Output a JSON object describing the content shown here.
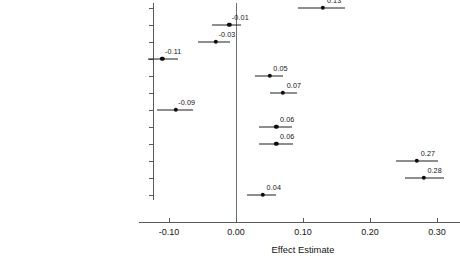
{
  "chart_data": {
    "type": "scatter",
    "subtype": "forest-plot",
    "title": "",
    "xlabel": "Effect Estimate",
    "ylabel": "",
    "xlim": [
      -0.145,
      0.335
    ],
    "xticks": [
      -0.1,
      0.0,
      0.1,
      0.2,
      0.3
    ],
    "xticklabels": [
      "-0.10",
      "0.00",
      "0.10",
      "0.20",
      "0.30"
    ],
    "grid": false,
    "legend": null,
    "reference_line": 0.0,
    "categories": [
      "Pay",
      "Working Hours",
      "Working Hours Mismatch",
      "Work-Life Imbalance",
      "Skills Match",
      "Job Security",
      "Difficulty, Stress, Danger",
      "Opportunities for Advancement",
      "Independence",
      "Interesting Job",
      "Interpersonal Relationships",
      "Usefulness"
    ],
    "values": [
      0.13,
      -0.01,
      -0.03,
      -0.11,
      0.05,
      0.07,
      -0.09,
      0.06,
      0.06,
      0.27,
      0.28,
      0.04
    ],
    "value_labels": [
      "0.13",
      "-0.01",
      "-0.03",
      "-0.11",
      "0.05",
      "0.07",
      "-0.09",
      "0.06",
      "0.06",
      "0.27",
      "0.28",
      "0.04"
    ],
    "ci_low": [
      0.093,
      -0.036,
      -0.056,
      -0.131,
      0.029,
      0.05,
      -0.118,
      0.034,
      0.035,
      0.239,
      0.252,
      0.017
    ],
    "ci_high": [
      0.163,
      0.007,
      -0.009,
      -0.086,
      0.07,
      0.091,
      -0.064,
      0.083,
      0.085,
      0.301,
      0.311,
      0.06
    ],
    "points": [
      {
        "label": "Pay",
        "estimate": 0.13,
        "ci_low": 0.093,
        "ci_high": 0.163
      },
      {
        "label": "Working Hours",
        "estimate": -0.01,
        "ci_low": -0.036,
        "ci_high": 0.007
      },
      {
        "label": "Working Hours Mismatch",
        "estimate": -0.03,
        "ci_low": -0.056,
        "ci_high": -0.009
      },
      {
        "label": "Work-Life Imbalance",
        "estimate": -0.11,
        "ci_low": -0.131,
        "ci_high": -0.086
      },
      {
        "label": "Skills Match",
        "estimate": 0.05,
        "ci_low": 0.029,
        "ci_high": 0.07
      },
      {
        "label": "Job Security",
        "estimate": 0.07,
        "ci_low": 0.05,
        "ci_high": 0.091
      },
      {
        "label": "Difficulty, Stress, Danger",
        "estimate": -0.09,
        "ci_low": -0.118,
        "ci_high": -0.064
      },
      {
        "label": "Opportunities for Advancement",
        "estimate": 0.06,
        "ci_low": 0.034,
        "ci_high": 0.083
      },
      {
        "label": "Independence",
        "estimate": 0.06,
        "ci_low": 0.035,
        "ci_high": 0.085
      },
      {
        "label": "Interesting Job",
        "estimate": 0.27,
        "ci_low": 0.239,
        "ci_high": 0.301
      },
      {
        "label": "Interpersonal Relationships",
        "estimate": 0.28,
        "ci_low": 0.252,
        "ci_high": 0.311
      },
      {
        "label": "Usefulness",
        "estimate": 0.04,
        "ci_low": 0.017,
        "ci_high": 0.06
      }
    ],
    "colors": {
      "marker": "#0d0d0d",
      "whisker": "#1f1f1f",
      "axis": "#555c5e",
      "reference": "#6a7173",
      "text": "#141414",
      "background": "#ffffff"
    }
  }
}
